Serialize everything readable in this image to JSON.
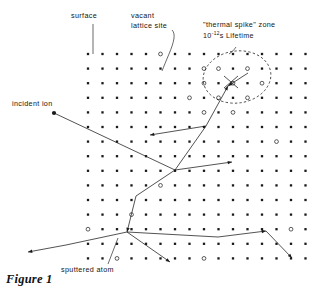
{
  "figure": {
    "caption": "Figure 1",
    "title_text": "Figure 1"
  },
  "labels": {
    "surface": "surface",
    "vacant_lattice_site_line1": "vacant",
    "vacant_lattice_site_line2": "lattice site",
    "thermal_spike_line1": "\"thermal spike\" zone",
    "thermal_spike_base": "10",
    "thermal_spike_exponent": "-12",
    "thermal_spike_tail": "s Lifetime",
    "incident_ion": "incident ion",
    "sputtered_atom": "sputtered atom"
  },
  "colors": {
    "ink": "#1a1a1a",
    "background": "#ffffff",
    "leader": "#2a2a2a"
  },
  "chart_data": {
    "type": "scatter",
    "title": "Figure 1",
    "xlabel": "",
    "ylabel": "",
    "lattice": {
      "origin_x": 88,
      "origin_y": 54,
      "spacing_x": 14.5,
      "spacing_y": 14.6,
      "cols": 16,
      "rows": 16,
      "marker": "filled-square-dot"
    },
    "vacancies": [
      [
        5,
        0
      ],
      [
        8,
        1
      ],
      [
        9,
        1
      ],
      [
        11,
        1
      ],
      [
        8,
        2
      ],
      [
        10,
        2
      ],
      [
        12,
        2
      ],
      [
        9,
        3
      ],
      [
        11,
        3
      ],
      [
        7,
        3
      ],
      [
        8,
        4
      ],
      [
        10,
        4
      ],
      [
        13,
        6
      ],
      [
        5,
        9
      ],
      [
        3,
        11
      ],
      [
        0,
        12
      ],
      [
        14,
        12
      ],
      [
        8,
        14
      ],
      [
        2,
        14
      ]
    ],
    "spike_zone": {
      "center_x": 237,
      "center_y": 77,
      "radius_x": 34,
      "radius_y": 26,
      "rotation_deg": -8,
      "lifetime_s": 1e-12,
      "style": "dashed-ellipse"
    },
    "incident_ion": {
      "entry_point": [
        54,
        113
      ],
      "direction_deg": 27
    },
    "cascade_tracks": [
      {
        "name": "primary",
        "points": [
          [
            54,
            113
          ],
          [
            175,
            170
          ],
          [
            232,
            162
          ]
        ]
      },
      {
        "name": "branch-up-right",
        "points": [
          [
            175,
            170
          ],
          [
            206,
            126
          ],
          [
            228,
            86
          ]
        ]
      },
      {
        "name": "branch-to-spike",
        "points": [
          [
            228,
            86
          ],
          [
            248,
            73
          ]
        ]
      },
      {
        "name": "branch-left-recoil",
        "points": [
          [
            206,
            126
          ],
          [
            150,
            135
          ]
        ]
      },
      {
        "name": "branch-down",
        "points": [
          [
            175,
            170
          ],
          [
            136,
            196
          ]
        ]
      },
      {
        "name": "branch-down-2",
        "points": [
          [
            136,
            196
          ],
          [
            127,
            232
          ]
        ]
      },
      {
        "name": "branch-deep-right",
        "points": [
          [
            127,
            232
          ],
          [
            218,
            237
          ],
          [
            266,
            231
          ]
        ]
      },
      {
        "name": "branch-sputter",
        "points": [
          [
            127,
            232
          ],
          [
            66,
            245
          ],
          [
            28,
            252
          ]
        ]
      },
      {
        "name": "branch-lower-mid",
        "points": [
          [
            127,
            232
          ],
          [
            170,
            262
          ]
        ]
      },
      {
        "name": "branch-right-down",
        "points": [
          [
            266,
            231
          ],
          [
            292,
            258
          ]
        ]
      },
      {
        "name": "spike-x",
        "points": [
          [
            224,
            88
          ],
          [
            238,
            76
          ]
        ]
      },
      {
        "name": "spike-x2",
        "points": [
          [
            224,
            76
          ],
          [
            238,
            88
          ]
        ]
      }
    ],
    "sputtered_atom": {
      "exit_point": [
        28,
        252
      ],
      "direction": "up-left-out-of-surface"
    }
  }
}
